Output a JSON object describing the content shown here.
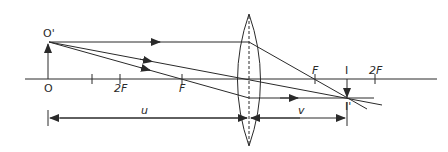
{
  "diagram": {
    "labels": {
      "object_top": "O'",
      "object_base": "O",
      "image_base": "I",
      "image_top": "I'",
      "focal_left": "F",
      "twice_focal_left": "2F",
      "focal_right": "F",
      "twice_focal_right": "2F",
      "object_distance": "u",
      "image_distance": "v"
    },
    "colors": {
      "line": "#2a2a2a",
      "background": "#ffffff"
    }
  }
}
